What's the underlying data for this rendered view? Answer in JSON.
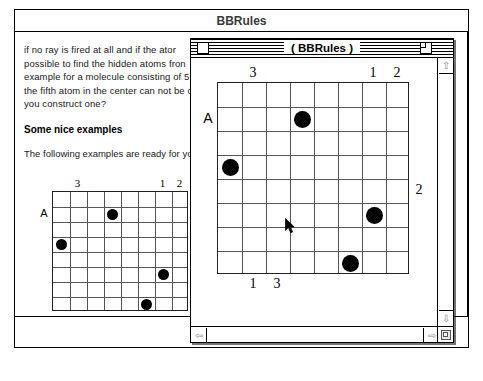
{
  "background_window": {
    "title": "BBRules",
    "document": {
      "paragraph_lines": [
        "if no ray is fired at all and if the ator",
        "possible to find the hidden atoms fron",
        "example for a molecule consisting of 5",
        "the fifth atom in the center can not be c",
        "you construct one?"
      ],
      "heading": "Some nice examples",
      "subtext": "The following examples are ready for yo"
    },
    "board": {
      "rows": 8,
      "cols": 8,
      "left_label": "A",
      "right_label": "2",
      "top_labels": [
        {
          "text": "3",
          "col": 1
        },
        {
          "text": "1",
          "col": 6
        },
        {
          "text": "2",
          "col": 7
        }
      ],
      "bottom_labels": [
        {
          "text": "1",
          "col": 1
        },
        {
          "text": "3",
          "col": 2
        }
      ],
      "atoms": [
        {
          "row": 1,
          "col": 3
        },
        {
          "row": 3,
          "col": 0
        },
        {
          "row": 5,
          "col": 6
        },
        {
          "row": 7,
          "col": 5
        }
      ],
      "atoms_count_label": "Atoms: 4"
    }
  },
  "foreground_window": {
    "title": "( BBRules )",
    "controls": {
      "close_box": "close-box",
      "zoom_box": "zoom-box",
      "grow_box": "grow-box"
    },
    "scrollbars": {
      "up_arrow": "⇧",
      "down_arrow": "⇩",
      "left_arrow": "⇦",
      "right_arrow": "⇨"
    },
    "board": {
      "rows": 8,
      "cols": 8,
      "left_label": "A",
      "right_label": "2",
      "top_labels": [
        {
          "text": "3",
          "col": 1
        },
        {
          "text": "1",
          "col": 6
        },
        {
          "text": "2",
          "col": 7
        }
      ],
      "bottom_labels": [
        {
          "text": "1",
          "col": 1
        },
        {
          "text": "3",
          "col": 2
        }
      ],
      "atoms": [
        {
          "row": 1,
          "col": 3
        },
        {
          "row": 3,
          "col": 0
        },
        {
          "row": 5,
          "col": 6
        },
        {
          "row": 7,
          "col": 5
        }
      ]
    },
    "cursor": {
      "x": 285,
      "y": 218
    }
  },
  "colors": {
    "atom": "#000000",
    "grid_line": "#555555",
    "grid_border": "#222222",
    "window_border": "#000000",
    "title_inactive": "#3a3a3a"
  }
}
